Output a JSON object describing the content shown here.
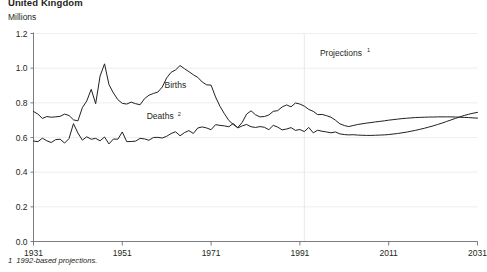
{
  "figure": {
    "title": "United Kingdom",
    "unit_label": "Millions",
    "footnote_number": "1",
    "footnote_text": "1992-based projections.",
    "line_color": "#231f20",
    "axis_color": "#6d6e71",
    "gridline_color": "#e8e8e8"
  },
  "annotations": {
    "projections": "Projections",
    "projections_sup": "1",
    "births": "Births",
    "deaths": "Deaths",
    "deaths_sup": "2"
  },
  "chart_data": {
    "type": "line",
    "title": "United Kingdom",
    "subtitle": "Millions",
    "xlabel": "",
    "ylabel": "Millions",
    "xlim": [
      1931,
      2031
    ],
    "ylim": [
      0.0,
      1.2
    ],
    "xticks": [
      1931,
      1951,
      1971,
      1991,
      2011,
      2031
    ],
    "yticks": [
      0.0,
      0.2,
      0.4,
      0.6,
      0.8,
      1.0,
      1.2
    ],
    "grid": false,
    "legend_position": "inline-labels",
    "projection_start_year": 1992,
    "annotations": [
      {
        "text": "Projections1",
        "x": 1996,
        "y": 1.08
      },
      {
        "text": "Births",
        "x": 1962,
        "y": 0.9
      },
      {
        "text": "Deaths2",
        "x": 1960,
        "y": 0.715
      }
    ],
    "series": [
      {
        "name": "Births",
        "x": [
          1931,
          1932,
          1933,
          1934,
          1935,
          1936,
          1937,
          1938,
          1939,
          1940,
          1941,
          1942,
          1943,
          1944,
          1945,
          1946,
          1947,
          1948,
          1949,
          1950,
          1951,
          1952,
          1953,
          1954,
          1955,
          1956,
          1957,
          1958,
          1959,
          1960,
          1961,
          1962,
          1963,
          1964,
          1965,
          1966,
          1967,
          1968,
          1969,
          1970,
          1971,
          1972,
          1973,
          1974,
          1975,
          1976,
          1977,
          1978,
          1979,
          1980,
          1981,
          1982,
          1983,
          1984,
          1985,
          1986,
          1987,
          1988,
          1989,
          1990,
          1991,
          1992,
          1993,
          1994,
          1995,
          1996,
          1997,
          1998,
          1999,
          2000,
          2001,
          2002,
          2003,
          2004,
          2005,
          2006,
          2007,
          2008,
          2009,
          2010,
          2011,
          2012,
          2013,
          2014,
          2015,
          2016,
          2017,
          2018,
          2019,
          2020,
          2021,
          2022,
          2023,
          2024,
          2025,
          2026,
          2027,
          2028,
          2029,
          2030,
          2031
        ],
        "values": [
          0.75,
          0.735,
          0.71,
          0.721,
          0.717,
          0.719,
          0.722,
          0.735,
          0.727,
          0.702,
          0.696,
          0.772,
          0.811,
          0.878,
          0.795,
          0.955,
          1.025,
          0.905,
          0.857,
          0.818,
          0.797,
          0.793,
          0.804,
          0.795,
          0.789,
          0.824,
          0.844,
          0.854,
          0.862,
          0.891,
          0.944,
          0.976,
          0.99,
          1.015,
          0.997,
          0.98,
          0.962,
          0.947,
          0.92,
          0.904,
          0.902,
          0.834,
          0.78,
          0.737,
          0.698,
          0.675,
          0.657,
          0.687,
          0.735,
          0.754,
          0.731,
          0.719,
          0.721,
          0.73,
          0.751,
          0.755,
          0.776,
          0.788,
          0.777,
          0.799,
          0.793,
          0.781,
          0.762,
          0.751,
          0.732,
          0.733,
          0.726,
          0.717,
          0.7,
          0.679,
          0.669,
          0.663,
          0.669,
          0.675,
          0.679,
          0.683,
          0.686,
          0.69,
          0.693,
          0.696,
          0.7,
          0.703,
          0.706,
          0.709,
          0.711,
          0.713,
          0.715,
          0.716,
          0.717,
          0.718,
          0.718,
          0.719,
          0.719,
          0.719,
          0.719,
          0.718,
          0.717,
          0.716,
          0.715,
          0.713,
          0.712
        ]
      },
      {
        "name": "Deaths",
        "x": [
          1931,
          1932,
          1933,
          1934,
          1935,
          1936,
          1937,
          1938,
          1939,
          1940,
          1941,
          1942,
          1943,
          1944,
          1945,
          1946,
          1947,
          1948,
          1949,
          1950,
          1951,
          1952,
          1953,
          1954,
          1955,
          1956,
          1957,
          1958,
          1959,
          1960,
          1961,
          1962,
          1963,
          1964,
          1965,
          1966,
          1967,
          1968,
          1969,
          1970,
          1971,
          1972,
          1973,
          1974,
          1975,
          1976,
          1977,
          1978,
          1979,
          1980,
          1981,
          1982,
          1983,
          1984,
          1985,
          1986,
          1987,
          1988,
          1989,
          1990,
          1991,
          1992,
          1993,
          1994,
          1995,
          1996,
          1997,
          1998,
          1999,
          2000,
          2001,
          2002,
          2003,
          2004,
          2005,
          2006,
          2007,
          2008,
          2009,
          2010,
          2011,
          2012,
          2013,
          2014,
          2015,
          2016,
          2017,
          2018,
          2019,
          2020,
          2021,
          2022,
          2023,
          2024,
          2025,
          2026,
          2027,
          2028,
          2029,
          2030,
          2031
        ],
        "values": [
          0.58,
          0.576,
          0.596,
          0.581,
          0.571,
          0.588,
          0.59,
          0.568,
          0.594,
          0.68,
          0.626,
          0.585,
          0.604,
          0.59,
          0.595,
          0.581,
          0.603,
          0.563,
          0.591,
          0.59,
          0.632,
          0.576,
          0.577,
          0.579,
          0.595,
          0.592,
          0.584,
          0.6,
          0.601,
          0.597,
          0.607,
          0.623,
          0.633,
          0.61,
          0.628,
          0.64,
          0.623,
          0.655,
          0.661,
          0.655,
          0.645,
          0.674,
          0.67,
          0.667,
          0.662,
          0.681,
          0.655,
          0.667,
          0.675,
          0.662,
          0.658,
          0.663,
          0.659,
          0.645,
          0.67,
          0.66,
          0.644,
          0.649,
          0.657,
          0.641,
          0.646,
          0.634,
          0.658,
          0.627,
          0.642,
          0.636,
          0.632,
          0.627,
          0.632,
          0.621,
          0.617,
          0.615,
          0.616,
          0.614,
          0.613,
          0.612,
          0.612,
          0.613,
          0.614,
          0.615,
          0.617,
          0.62,
          0.623,
          0.627,
          0.631,
          0.636,
          0.641,
          0.647,
          0.653,
          0.66,
          0.667,
          0.675,
          0.683,
          0.692,
          0.701,
          0.71,
          0.719,
          0.727,
          0.734,
          0.74,
          0.745
        ]
      }
    ]
  }
}
